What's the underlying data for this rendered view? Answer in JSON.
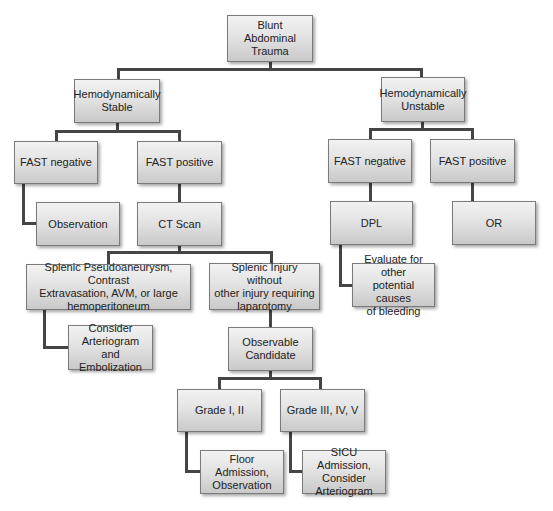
{
  "colors": {
    "box_top": "#f2f2f2",
    "box_bottom": "#c9c9c9",
    "box_border": "#7a7a7a",
    "connector": "#454545",
    "text": "#222222",
    "background": "#ffffff"
  },
  "nodes": {
    "root": {
      "label": "Blunt Abdominal\nTrauma",
      "box": [
        227,
        15,
        86,
        47
      ]
    },
    "stable": {
      "label": "Hemodynamically\nStable",
      "box": [
        74,
        79,
        86,
        44
      ]
    },
    "unstable": {
      "label": "Hemodynamically\nUnstable",
      "box": [
        381,
        77,
        84,
        45
      ]
    },
    "stable_fast_neg": {
      "label": "FAST negative",
      "box": [
        14,
        141,
        84,
        43
      ]
    },
    "stable_fast_pos": {
      "label": "FAST positive",
      "box": [
        137,
        141,
        85,
        43
      ]
    },
    "unstable_fast_neg": {
      "label": "FAST negative",
      "box": [
        328,
        139,
        84,
        44
      ]
    },
    "unstable_fast_pos": {
      "label": "FAST positive",
      "box": [
        430,
        139,
        85,
        44
      ]
    },
    "observation": {
      "label": "Observation",
      "box": [
        36,
        202,
        84,
        44
      ]
    },
    "ct_scan": {
      "label": "CT Scan",
      "box": [
        137,
        202,
        85,
        44
      ]
    },
    "dpl": {
      "label": "DPL",
      "box": [
        330,
        201,
        83,
        44
      ]
    },
    "or": {
      "label": "OR",
      "box": [
        452,
        201,
        84,
        44
      ]
    },
    "pseudoaneurysm": {
      "label": "Splenic Pseudoaneurysm, Contrast\nExtravasation, AVM, or large\nhemoperitoneum",
      "box": [
        26,
        264,
        165,
        46
      ]
    },
    "splenic_injury": {
      "label": "Splenic Injury without\nother injury requiring\nlaparotomy",
      "box": [
        209,
        263,
        111,
        47
      ]
    },
    "evaluate_other": {
      "label": "Evaluate for other\npotential causes\nof bleeding",
      "box": [
        352,
        263,
        83,
        44
      ]
    },
    "consider_arteriogram": {
      "label": "Consider\nArteriogram and\nEmbolization",
      "box": [
        68,
        325,
        85,
        45
      ]
    },
    "observable_candidate": {
      "label": "Observable\nCandidate",
      "box": [
        228,
        327,
        85,
        44
      ]
    },
    "grade_1_2": {
      "label": "Grade I, II",
      "box": [
        177,
        389,
        85,
        43
      ]
    },
    "grade_3_5": {
      "label": "Grade III, IV, V",
      "box": [
        280,
        389,
        85,
        43
      ]
    },
    "floor_admission": {
      "label": "Floor Admission,\nObservation",
      "box": [
        200,
        450,
        84,
        44
      ]
    },
    "sicu_admission": {
      "label": "SICU Admission,\nConsider\nArteriogram",
      "box": [
        302,
        450,
        84,
        44
      ]
    }
  },
  "edges": [
    {
      "from": "root",
      "to": "stable"
    },
    {
      "from": "root",
      "to": "unstable"
    },
    {
      "from": "stable",
      "to": "stable_fast_neg"
    },
    {
      "from": "stable",
      "to": "stable_fast_pos"
    },
    {
      "from": "unstable",
      "to": "unstable_fast_neg"
    },
    {
      "from": "unstable",
      "to": "unstable_fast_pos"
    },
    {
      "from": "stable_fast_neg",
      "to": "observation"
    },
    {
      "from": "stable_fast_pos",
      "to": "ct_scan"
    },
    {
      "from": "unstable_fast_neg",
      "to": "dpl"
    },
    {
      "from": "unstable_fast_pos",
      "to": "or"
    },
    {
      "from": "ct_scan",
      "to": "pseudoaneurysm"
    },
    {
      "from": "ct_scan",
      "to": "splenic_injury"
    },
    {
      "from": "dpl",
      "to": "evaluate_other"
    },
    {
      "from": "pseudoaneurysm",
      "to": "consider_arteriogram"
    },
    {
      "from": "splenic_injury",
      "to": "observable_candidate"
    },
    {
      "from": "observable_candidate",
      "to": "grade_1_2"
    },
    {
      "from": "observable_candidate",
      "to": "grade_3_5"
    },
    {
      "from": "grade_1_2",
      "to": "floor_admission"
    },
    {
      "from": "grade_3_5",
      "to": "sicu_admission"
    }
  ],
  "connector_segments": [
    [
      269,
      62,
      3,
      9
    ],
    [
      117,
      68,
      306,
      3
    ],
    [
      117,
      68,
      3,
      11
    ],
    [
      420,
      68,
      3,
      9
    ],
    [
      116,
      123,
      3,
      9
    ],
    [
      55,
      130,
      126,
      3
    ],
    [
      55,
      130,
      3,
      11
    ],
    [
      178,
      130,
      3,
      11
    ],
    [
      421,
      122,
      3,
      8
    ],
    [
      369,
      128,
      105,
      3
    ],
    [
      369,
      128,
      3,
      11
    ],
    [
      471,
      128,
      3,
      11
    ],
    [
      22,
      184,
      3,
      41
    ],
    [
      22,
      222,
      14,
      3
    ],
    [
      178,
      184,
      3,
      18
    ],
    [
      369,
      183,
      3,
      18
    ],
    [
      471,
      183,
      3,
      41
    ],
    [
      471,
      221,
      14,
      3
    ],
    [
      178,
      246,
      3,
      7
    ],
    [
      107,
      251,
      166,
      3
    ],
    [
      107,
      251,
      3,
      13
    ],
    [
      270,
      251,
      3,
      12
    ],
    [
      339,
      245,
      3,
      42
    ],
    [
      339,
      284,
      13,
      3
    ],
    [
      43,
      310,
      3,
      39
    ],
    [
      43,
      346,
      25,
      3
    ],
    [
      269,
      310,
      3,
      17
    ],
    [
      269,
      371,
      3,
      8
    ],
    [
      218,
      377,
      104,
      3
    ],
    [
      218,
      377,
      3,
      12
    ],
    [
      319,
      377,
      3,
      12
    ],
    [
      185,
      432,
      3,
      41
    ],
    [
      185,
      470,
      15,
      3
    ],
    [
      289,
      432,
      3,
      41
    ],
    [
      289,
      470,
      13,
      3
    ]
  ]
}
